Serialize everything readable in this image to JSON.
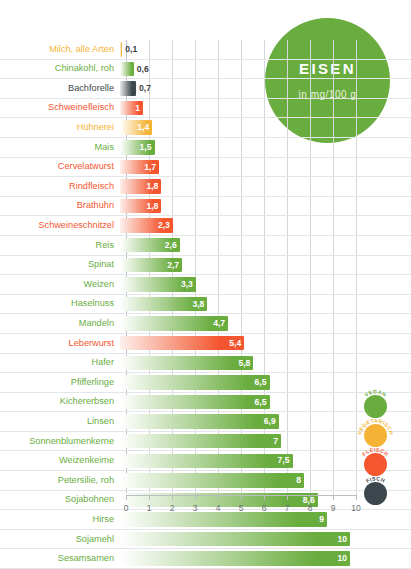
{
  "title": {
    "main": "EISEN",
    "sub": "in mg/100 g"
  },
  "axis": {
    "ticks": [
      "0",
      "1",
      "2",
      "3",
      "4",
      "5",
      "6",
      "7",
      "8",
      "9",
      "10"
    ]
  },
  "legend": [
    {
      "label": "VEGAN",
      "color": "#6aad3f"
    },
    {
      "label": "VEGETARISCH",
      "color": "#f5b335"
    },
    {
      "label": "FLEISCH",
      "color": "#f4562f"
    },
    {
      "label": "FISCH",
      "color": "#3c474d"
    }
  ],
  "colors": {
    "vegan": "#6aad3f",
    "vegetarisch": "#f5b335",
    "fleisch": "#f4562f",
    "fisch": "#3c474d",
    "grid": "#d4d8db",
    "background": "#ffffff"
  },
  "chart_data": {
    "type": "bar",
    "orientation": "horizontal",
    "title": "EISEN",
    "subtitle": "in mg/100 g",
    "xlabel": "",
    "ylabel": "",
    "xlim": [
      0,
      10
    ],
    "grid": true,
    "legend_position": "right-bottom",
    "categories": [
      "Milch, alle Arten",
      "Chinakohl, roh",
      "Bachforelle",
      "Schweinefleisch",
      "Hühnerei",
      "Mais",
      "Cervelatwurst",
      "Rindfleisch",
      "Brathuhn",
      "Schweineschnitzel",
      "Reis",
      "Spinat",
      "Weizen",
      "Haselnuss",
      "Mandeln",
      "Leberwurst",
      "Hafer",
      "Pfifferlinge",
      "Kichererbsen",
      "Linsen",
      "Sonnenblumenkerne",
      "Weizenkeime",
      "Petersilie, roh",
      "Sojabohnen",
      "Hirse",
      "Sojamehl",
      "Sesamsamen"
    ],
    "values": [
      0.1,
      0.6,
      0.7,
      1,
      1.4,
      1.5,
      1.7,
      1.8,
      1.8,
      2.3,
      2.6,
      2.7,
      3.3,
      3.8,
      4.7,
      5.4,
      5.8,
      6.5,
      6.5,
      6.9,
      7,
      7.5,
      8,
      8.6,
      9,
      10,
      10
    ],
    "value_labels": [
      "0,1",
      "0,6",
      "0,7",
      "1",
      "1,4",
      "1,5",
      "1,7",
      "1,8",
      "1,8",
      "2,3",
      "2,6",
      "2,7",
      "3,3",
      "3,8",
      "4,7",
      "5,4",
      "5,8",
      "6,5",
      "6,5",
      "6,9",
      "7",
      "7,5",
      "8",
      "8,6",
      "9",
      "10",
      "10"
    ],
    "groups": [
      "vegetarisch",
      "vegan",
      "fisch",
      "fleisch",
      "vegetarisch",
      "vegan",
      "fleisch",
      "fleisch",
      "fleisch",
      "fleisch",
      "vegan",
      "vegan",
      "vegan",
      "vegan",
      "vegan",
      "fleisch",
      "vegan",
      "vegan",
      "vegan",
      "vegan",
      "vegan",
      "vegan",
      "vegan",
      "vegan",
      "vegan",
      "vegan",
      "vegan"
    ]
  }
}
